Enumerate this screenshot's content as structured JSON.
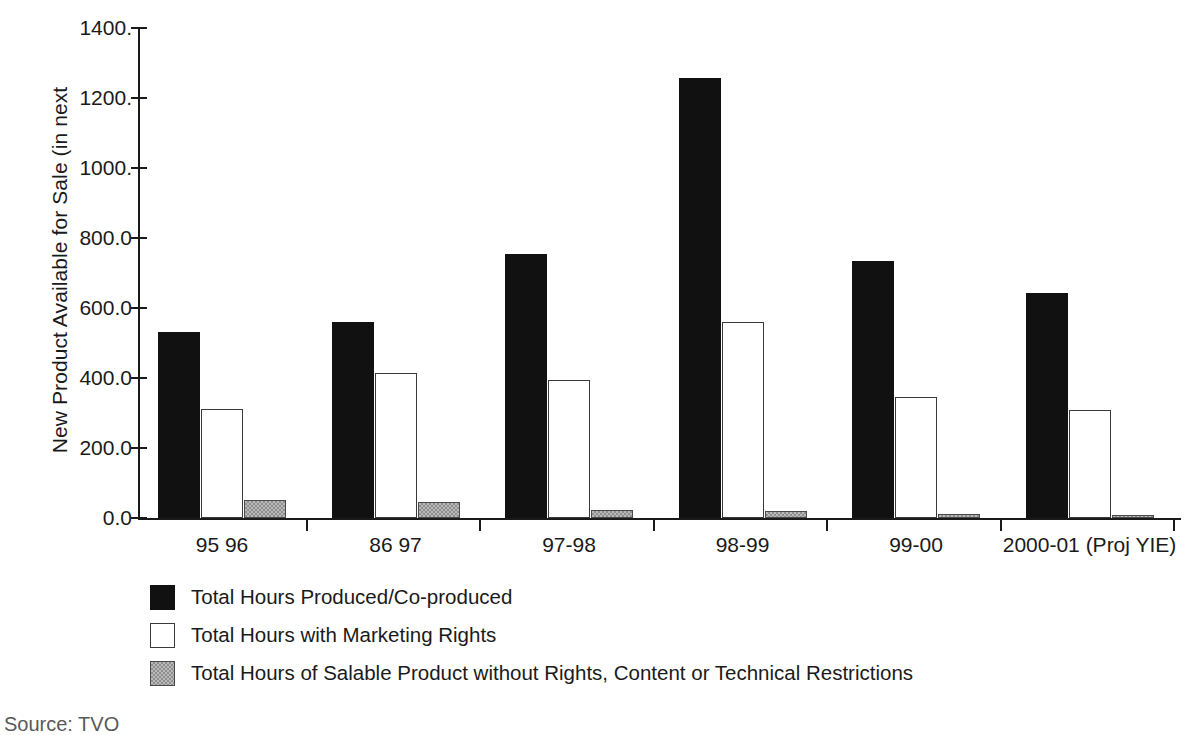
{
  "chart_data": {
    "type": "bar",
    "title": "",
    "xlabel": "",
    "ylabel": "New Product Available for Sale (in next",
    "ylim": [
      0,
      1400
    ],
    "ytick_labels": [
      "0.0",
      "200.0",
      "400.0",
      "600.0",
      "800.0",
      "1000.",
      "1200.",
      "1400."
    ],
    "ytick_values": [
      0,
      200,
      400,
      600,
      800,
      1000,
      1200,
      1400
    ],
    "grid": false,
    "legend_position": "below-axis-left",
    "categories": [
      "95 96",
      "86 97",
      "97-98",
      "98-99",
      "99-00",
      "2000-01 (Proj YIE)"
    ],
    "series": [
      {
        "name": "Total Hours Produced/Co-produced",
        "color": "#111111",
        "fill": "solid-black",
        "values": [
          532,
          560,
          754,
          1257,
          734,
          643
        ]
      },
      {
        "name": "Total Hours with Marketing Rights",
        "color": "#ffffff",
        "fill": "white-outline",
        "values": [
          311,
          414,
          394,
          560,
          346,
          308
        ]
      },
      {
        "name": "Total Hours of Salable Product without Rights, Content or Technical Restrictions",
        "color": "#b9b9b9",
        "fill": "gray-hatch",
        "values": [
          51,
          46,
          22,
          21,
          12,
          9
        ]
      }
    ]
  },
  "footnote": "Source: TVO",
  "axis": {
    "y_axis_color": "#1a1a1a",
    "x_axis_color": "#1a1a1a"
  }
}
